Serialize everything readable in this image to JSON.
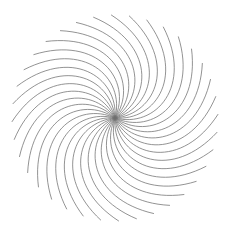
{
  "figure": {
    "width": 230,
    "height": 233,
    "background": "#ffffff",
    "stroke_color": "#6f6f6f",
    "stroke_width": 0.75,
    "center": {
      "x": 115,
      "y": 118
    },
    "outer_radius": 103,
    "strand_count": 36,
    "strand_shape": {
      "c1": {
        "r": 42,
        "deg": 55
      },
      "c2": {
        "r": 85,
        "deg": 18
      },
      "end": {
        "r": 103,
        "deg": -22
      }
    }
  }
}
